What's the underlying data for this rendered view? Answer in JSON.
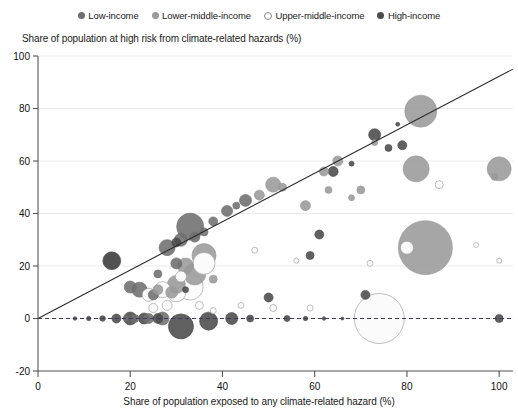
{
  "legend": {
    "position": "top-center",
    "items": [
      {
        "label": "Low-income",
        "marker": "filled-circle",
        "color": "#6e6e6e"
      },
      {
        "label": "Lower-middle-income",
        "marker": "filled-circle",
        "color": "#9a9a9a"
      },
      {
        "label": "Upper-middle-income",
        "marker": "open-circle",
        "color": "#ffffff"
      },
      {
        "label": "High-income",
        "marker": "filled-circle",
        "color": "#4a4a4a"
      }
    ]
  },
  "axes": {
    "y_title": "Share of population at high risk from climate-related hazards (%)",
    "x_title": "Share of population exposed to any climate-related hazard (%)",
    "y_ticks": [
      "100",
      "80",
      "60",
      "40",
      "20",
      "0",
      "-20"
    ],
    "x_ticks": [
      "0",
      "20",
      "40",
      "60",
      "80",
      "100"
    ]
  },
  "chart_data": {
    "type": "scatter",
    "title": "",
    "xlabel": "Share of population exposed to any climate-related hazard (%)",
    "ylabel": "Share of population at high risk from climate-related hazards (%)",
    "xlim": [
      0,
      103
    ],
    "ylim": [
      -20,
      100
    ],
    "grid": "horizontal",
    "legend_position": "top-center",
    "bubble_size_meaning": "population",
    "annotations": [
      {
        "type": "trendline",
        "from": [
          0,
          0
        ],
        "to": [
          103,
          95
        ],
        "style": "solid"
      },
      {
        "type": "reference-line",
        "y": 0,
        "style": "dashed"
      }
    ],
    "series": [
      {
        "name": "Low-income",
        "color": "#6e6e6e",
        "points": [
          {
            "x": 16,
            "y": 22,
            "r": 9.0
          },
          {
            "x": 20,
            "y": 12,
            "r": 6.0
          },
          {
            "x": 22,
            "y": 11,
            "r": 7.5
          },
          {
            "x": 25,
            "y": 9,
            "r": 5.0
          },
          {
            "x": 26,
            "y": 17,
            "r": 4.0
          },
          {
            "x": 28,
            "y": 27,
            "r": 8.0
          },
          {
            "x": 30,
            "y": 21,
            "r": 5.5
          },
          {
            "x": 31,
            "y": 30,
            "r": 6.5
          },
          {
            "x": 33,
            "y": 35,
            "r": 13.5
          },
          {
            "x": 34,
            "y": 31,
            "r": 5.0
          },
          {
            "x": 36,
            "y": 33,
            "r": 4.0
          },
          {
            "x": 38,
            "y": 37,
            "r": 4.5
          },
          {
            "x": 41,
            "y": 41,
            "r": 5.5
          },
          {
            "x": 43,
            "y": 43,
            "r": 3.5
          },
          {
            "x": 45,
            "y": 45,
            "r": 6.0
          },
          {
            "x": 24,
            "y": 0,
            "r": 5.0
          },
          {
            "x": 27,
            "y": 0,
            "r": 6.5
          },
          {
            "x": 21,
            "y": 0,
            "r": 4.0
          },
          {
            "x": 19,
            "y": 0,
            "r": 2.5
          }
        ]
      },
      {
        "name": "Lower-middle-income",
        "color": "#9a9a9a",
        "points": [
          {
            "x": 30,
            "y": 13,
            "r": 9.0
          },
          {
            "x": 32,
            "y": 20,
            "r": 8.0
          },
          {
            "x": 34,
            "y": 17,
            "r": 11.0
          },
          {
            "x": 36,
            "y": 24,
            "r": 12.0
          },
          {
            "x": 29,
            "y": 10,
            "r": 6.0
          },
          {
            "x": 26,
            "y": 11,
            "r": 5.0
          },
          {
            "x": 38,
            "y": 15,
            "r": 4.0
          },
          {
            "x": 48,
            "y": 47,
            "r": 5.0
          },
          {
            "x": 51,
            "y": 51,
            "r": 7.5
          },
          {
            "x": 53,
            "y": 50,
            "r": 4.0
          },
          {
            "x": 58,
            "y": 43,
            "r": 5.0
          },
          {
            "x": 62,
            "y": 56,
            "r": 4.5
          },
          {
            "x": 65,
            "y": 60,
            "r": 5.0
          },
          {
            "x": 73,
            "y": 67,
            "r": 3.0
          },
          {
            "x": 83,
            "y": 79,
            "r": 16.0
          },
          {
            "x": 82,
            "y": 57,
            "r": 13.0
          },
          {
            "x": 100,
            "y": 57,
            "r": 12.0
          },
          {
            "x": 84,
            "y": 27,
            "r": 27.0
          },
          {
            "x": 70,
            "y": 49,
            "r": 4.0
          },
          {
            "x": 68,
            "y": 46,
            "r": 3.0
          },
          {
            "x": 63,
            "y": 49,
            "r": 3.5
          },
          {
            "x": 99,
            "y": 54,
            "r": 3.5
          }
        ]
      },
      {
        "name": "Upper-middle-income",
        "color": "#ffffff",
        "points": [
          {
            "x": 33,
            "y": 12,
            "r": 13.0
          },
          {
            "x": 30,
            "y": 10,
            "r": 9.5
          },
          {
            "x": 27,
            "y": 11,
            "r": 8.0
          },
          {
            "x": 24,
            "y": 9,
            "r": 6.5
          },
          {
            "x": 36,
            "y": 21,
            "r": 11.0
          },
          {
            "x": 31,
            "y": 16,
            "r": 5.5
          },
          {
            "x": 28,
            "y": 5,
            "r": 5.0
          },
          {
            "x": 35,
            "y": 5,
            "r": 4.0
          },
          {
            "x": 25,
            "y": 4,
            "r": 4.5
          },
          {
            "x": 38,
            "y": 3,
            "r": 3.0
          },
          {
            "x": 47,
            "y": 26,
            "r": 3.0
          },
          {
            "x": 56,
            "y": 22,
            "r": 2.5
          },
          {
            "x": 51,
            "y": 4,
            "r": 3.5
          },
          {
            "x": 59,
            "y": 4,
            "r": 3.0
          },
          {
            "x": 74,
            "y": 0,
            "r": 25.0
          },
          {
            "x": 80,
            "y": 27,
            "r": 6.5
          },
          {
            "x": 72,
            "y": 21,
            "r": 3.0
          },
          {
            "x": 95,
            "y": 28,
            "r": 2.5
          },
          {
            "x": 100,
            "y": 22,
            "r": 2.5
          },
          {
            "x": 87,
            "y": 51,
            "r": 4.0
          },
          {
            "x": 44,
            "y": 5,
            "r": 3.0
          }
        ]
      },
      {
        "name": "High-income",
        "color": "#4a4a4a",
        "points": [
          {
            "x": 8,
            "y": 0,
            "r": 1.8
          },
          {
            "x": 11,
            "y": 0,
            "r": 2.2
          },
          {
            "x": 14,
            "y": 0,
            "r": 2.8
          },
          {
            "x": 17,
            "y": 0,
            "r": 4.5
          },
          {
            "x": 20,
            "y": 0,
            "r": 6.5
          },
          {
            "x": 23,
            "y": 0,
            "r": 5.5
          },
          {
            "x": 26,
            "y": 0,
            "r": 5.0
          },
          {
            "x": 31,
            "y": -3,
            "r": 12.5
          },
          {
            "x": 37,
            "y": -1,
            "r": 9.0
          },
          {
            "x": 42,
            "y": 0,
            "r": 6.0
          },
          {
            "x": 46,
            "y": 0,
            "r": 3.5
          },
          {
            "x": 50,
            "y": 8,
            "r": 4.5
          },
          {
            "x": 54,
            "y": 0,
            "r": 3.0
          },
          {
            "x": 58,
            "y": 0,
            "r": 2.2
          },
          {
            "x": 62,
            "y": 0,
            "r": 1.8
          },
          {
            "x": 66,
            "y": 0,
            "r": 1.5
          },
          {
            "x": 71,
            "y": 9,
            "r": 4.5
          },
          {
            "x": 100,
            "y": 0,
            "r": 4.0
          },
          {
            "x": 16,
            "y": 22,
            "r": 8.5
          },
          {
            "x": 30,
            "y": 29,
            "r": 4.5
          },
          {
            "x": 32,
            "y": 11,
            "r": 3.0
          },
          {
            "x": 59,
            "y": 24,
            "r": 4.0
          },
          {
            "x": 61,
            "y": 32,
            "r": 4.5
          },
          {
            "x": 73,
            "y": 70,
            "r": 6.0
          },
          {
            "x": 76,
            "y": 65,
            "r": 3.5
          },
          {
            "x": 79,
            "y": 66,
            "r": 4.5
          },
          {
            "x": 78,
            "y": 74,
            "r": 2.0
          },
          {
            "x": 68,
            "y": 59,
            "r": 2.5
          },
          {
            "x": 64,
            "y": 56,
            "r": 5.0
          }
        ]
      }
    ]
  }
}
